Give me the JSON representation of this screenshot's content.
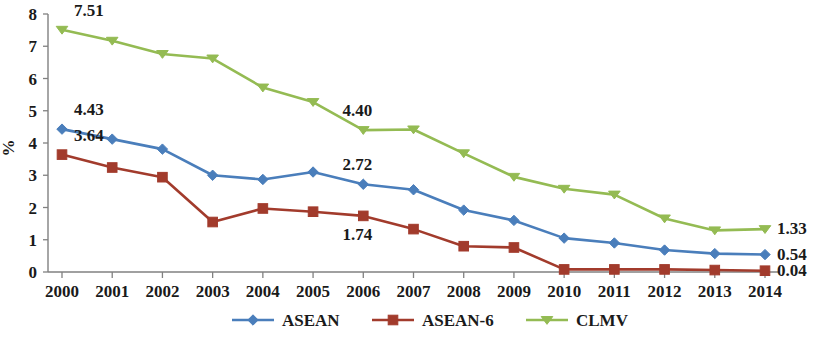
{
  "chart_data": {
    "type": "line",
    "title": "",
    "xlabel": "",
    "ylabel": "%",
    "ylim": [
      0,
      8
    ],
    "ytick_labels": [
      "0",
      "1",
      "2",
      "3",
      "4",
      "5",
      "6",
      "7",
      "8"
    ],
    "grid": false,
    "legend_position": "bottom",
    "categories": [
      "2000",
      "2001",
      "2002",
      "2003",
      "2004",
      "2005",
      "2006",
      "2007",
      "2008",
      "2009",
      "2010",
      "2011",
      "2012",
      "2013",
      "2014"
    ],
    "series": [
      {
        "name": "ASEAN",
        "color": "#4a7ebb",
        "marker": "diamond",
        "values": [
          4.43,
          4.12,
          3.81,
          3.0,
          2.87,
          3.1,
          2.72,
          2.55,
          1.92,
          1.6,
          1.05,
          0.9,
          0.68,
          0.57,
          0.54
        ]
      },
      {
        "name": "ASEAN-6",
        "color": "#a23b2c",
        "marker": "square",
        "values": [
          3.64,
          3.24,
          2.94,
          1.55,
          1.97,
          1.87,
          1.74,
          1.33,
          0.8,
          0.76,
          0.08,
          0.08,
          0.08,
          0.06,
          0.04
        ]
      },
      {
        "name": "CLMV",
        "color": "#94bb53",
        "marker": "triangle",
        "values": [
          7.51,
          7.17,
          6.76,
          6.62,
          5.72,
          5.27,
          4.4,
          4.42,
          3.68,
          2.95,
          2.58,
          2.4,
          1.66,
          1.29,
          1.33
        ]
      }
    ],
    "annotations": [
      {
        "text": "7.51",
        "series": "CLMV",
        "at": "2000",
        "side": "left"
      },
      {
        "text": "4.43",
        "series": "ASEAN",
        "at": "2000",
        "side": "left"
      },
      {
        "text": "3.64",
        "series": "ASEAN-6",
        "at": "2000",
        "side": "left"
      },
      {
        "text": "4.40",
        "series": "CLMV",
        "at": "2006",
        "side": "above"
      },
      {
        "text": "2.72",
        "series": "ASEAN",
        "at": "2006",
        "side": "above"
      },
      {
        "text": "1.74",
        "series": "ASEAN-6",
        "at": "2006",
        "side": "below"
      },
      {
        "text": "1.33",
        "series": "CLMV",
        "at": "2014",
        "side": "right"
      },
      {
        "text": "0.54",
        "series": "ASEAN",
        "at": "2014",
        "side": "right"
      },
      {
        "text": "0.04",
        "series": "ASEAN-6",
        "at": "2014",
        "side": "right"
      }
    ]
  },
  "legend": {
    "items": [
      {
        "label": "ASEAN"
      },
      {
        "label": "ASEAN-6"
      },
      {
        "label": "CLMV"
      }
    ]
  }
}
